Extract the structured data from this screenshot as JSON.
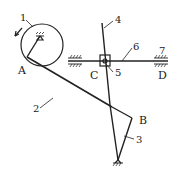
{
  "diagram": {
    "type": "mechanism-schematic",
    "colors": {
      "stroke": "#222222",
      "background": "#ffffff"
    },
    "points": {
      "A": "A",
      "B": "B",
      "C": "C",
      "D": "D"
    },
    "members": {
      "m1": "1",
      "m2": "2",
      "m3": "3",
      "m4": "4",
      "m5": "5",
      "m6": "6",
      "m7": "7"
    }
  }
}
